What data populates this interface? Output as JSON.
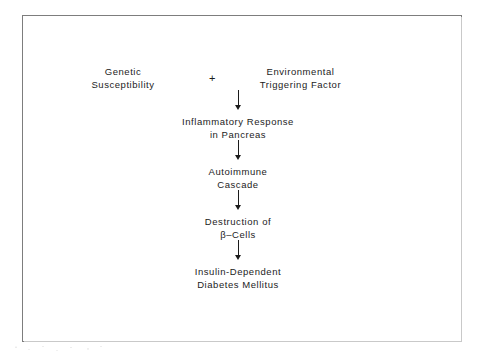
{
  "figure": {
    "type": "flowchart",
    "orientation": "top-to-bottom",
    "border_color": "#7d7d7d",
    "text_color": "#1c1c1c",
    "background_color": "#ffffff",
    "operator": "+",
    "arrow_glyph": "down-arrow",
    "nodes": [
      {
        "id": "genetic",
        "line1": "Genetic",
        "line2": "Susceptibility"
      },
      {
        "id": "environmental",
        "line1": "Environmental",
        "line2": "Triggering Factor"
      },
      {
        "id": "inflammatory",
        "line1": "Inflammatory Response",
        "line2": "in Pancreas"
      },
      {
        "id": "autoimmune",
        "line1": "Autoimmune",
        "line2": "Cascade"
      },
      {
        "id": "destruction",
        "line1": "Destruction of",
        "line2": "β–Cells"
      },
      {
        "id": "insulin_dependent",
        "line1": "Insulin-Dependent",
        "line2": "Diabetes Mellitus"
      }
    ]
  }
}
